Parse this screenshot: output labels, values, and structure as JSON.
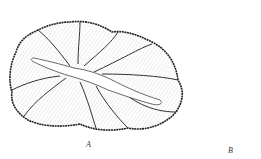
{
  "figure": {
    "panels": [
      {
        "id": "A",
        "label": "A",
        "description": "large lobed section with central lumen and radiating septa"
      },
      {
        "id": "B",
        "label": "B",
        "description": "small oval section with dark stippled wall and branching lumen"
      }
    ],
    "colors": {
      "ink": "#1a1a1a",
      "fill": "#f4f4f4",
      "background": "#ffffff"
    }
  }
}
